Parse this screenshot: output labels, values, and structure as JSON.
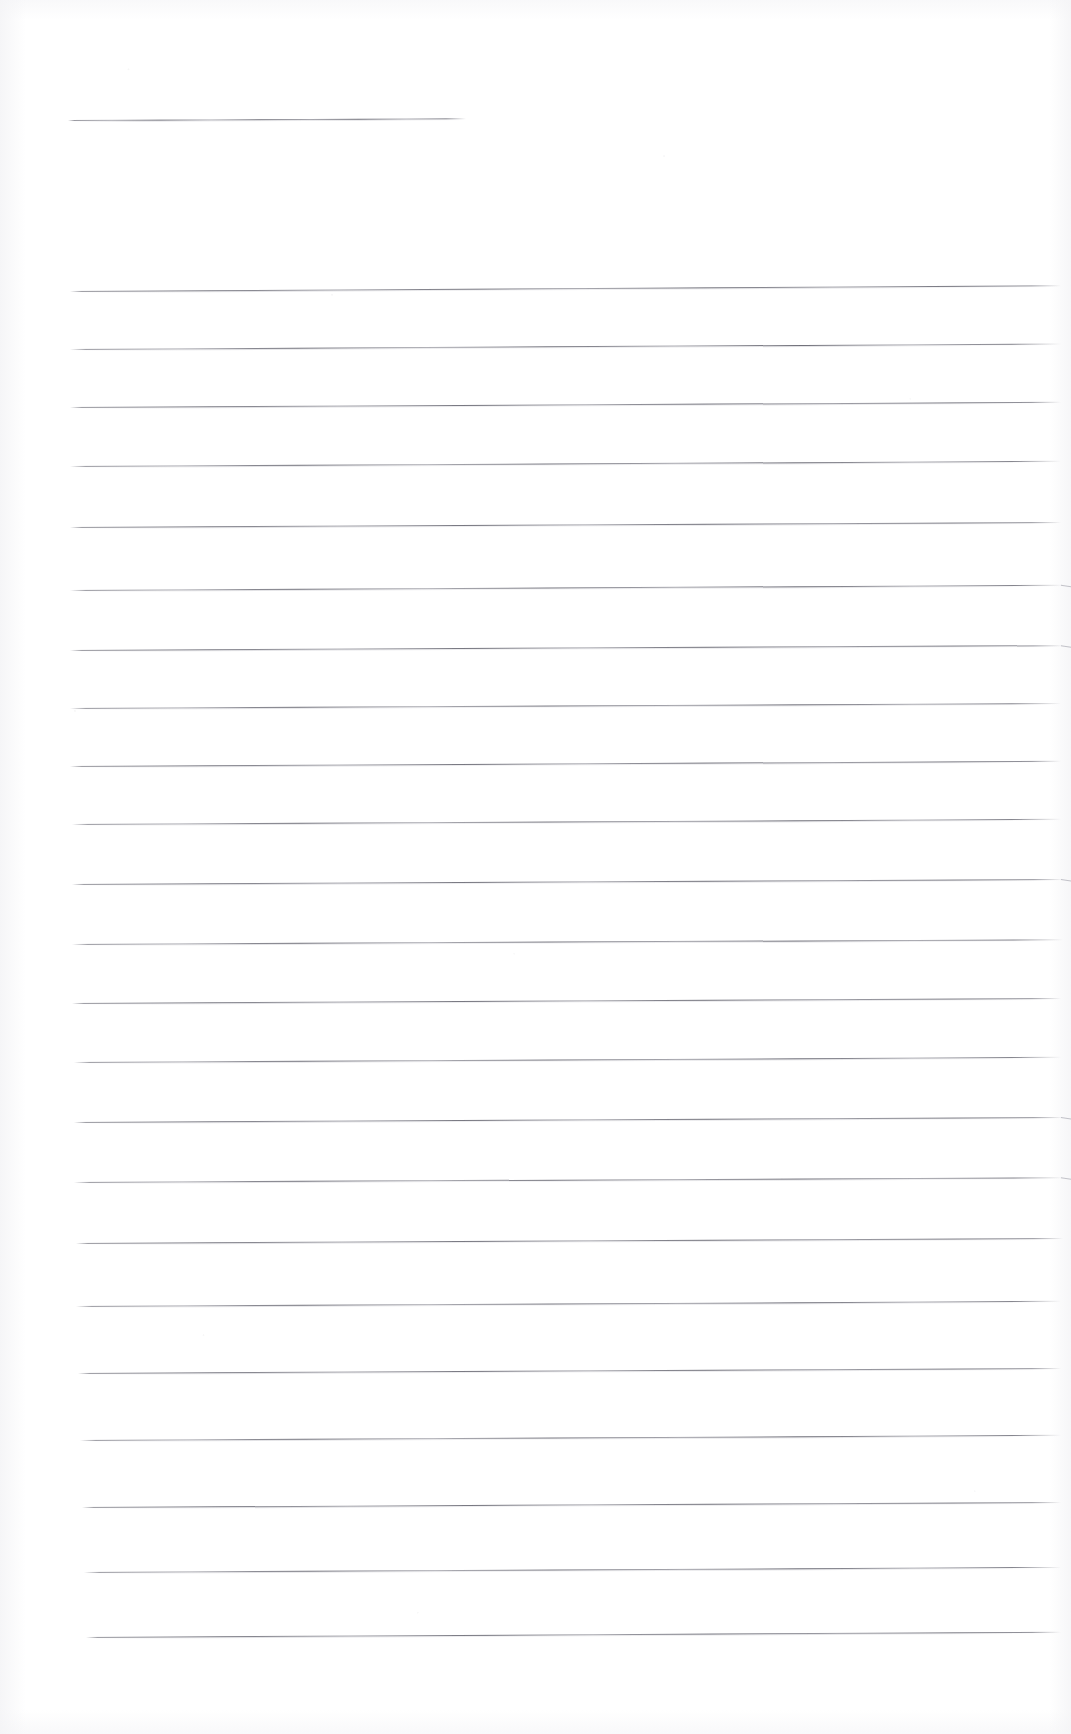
{
  "document": {
    "kind": "scanned-lined-paper",
    "title": "Blank ruled notepaper sheet",
    "page_width": 1071,
    "page_height": 1734,
    "background_color": "#ffffff",
    "rule_color": "#70707a",
    "text_content": "",
    "visible_text": []
  },
  "rules": [
    {
      "name": "rule-header",
      "x": 68,
      "y": 120,
      "width": 398,
      "rotate": -0.26,
      "style": "alt",
      "hooked": false
    },
    {
      "name": "rule-01",
      "x": 70,
      "y": 291,
      "width": 991,
      "rotate": -0.33,
      "style": "",
      "hooked": false
    },
    {
      "name": "rule-02",
      "x": 70,
      "y": 349,
      "width": 991,
      "rotate": -0.32,
      "style": "alt",
      "hooked": false
    },
    {
      "name": "rule-03",
      "x": 70,
      "y": 407,
      "width": 991,
      "rotate": -0.3,
      "style": "",
      "hooked": false
    },
    {
      "name": "rule-04",
      "x": 70,
      "y": 466,
      "width": 991,
      "rotate": -0.3,
      "style": "alt",
      "hooked": false
    },
    {
      "name": "rule-05",
      "x": 70,
      "y": 527,
      "width": 991,
      "rotate": -0.29,
      "style": "",
      "hooked": false
    },
    {
      "name": "rule-06",
      "x": 70,
      "y": 590,
      "width": 993,
      "rotate": -0.3,
      "style": "alt",
      "hooked": true
    },
    {
      "name": "rule-07",
      "x": 70,
      "y": 650,
      "width": 993,
      "rotate": -0.28,
      "style": "",
      "hooked": true
    },
    {
      "name": "rule-08",
      "x": 70,
      "y": 708,
      "width": 991,
      "rotate": -0.29,
      "style": "alt",
      "hooked": false
    },
    {
      "name": "rule-09",
      "x": 70,
      "y": 766,
      "width": 991,
      "rotate": -0.3,
      "style": "",
      "hooked": false
    },
    {
      "name": "rule-10",
      "x": 72,
      "y": 824,
      "width": 989,
      "rotate": -0.3,
      "style": "alt",
      "hooked": false
    },
    {
      "name": "rule-11",
      "x": 72,
      "y": 884,
      "width": 991,
      "rotate": -0.29,
      "style": "",
      "hooked": true
    },
    {
      "name": "rule-12",
      "x": 72,
      "y": 944,
      "width": 991,
      "rotate": -0.28,
      "style": "alt",
      "hooked": false
    },
    {
      "name": "rule-13",
      "x": 72,
      "y": 1003,
      "width": 989,
      "rotate": -0.29,
      "style": "",
      "hooked": false
    },
    {
      "name": "rule-14",
      "x": 74,
      "y": 1062,
      "width": 987,
      "rotate": -0.3,
      "style": "alt",
      "hooked": false
    },
    {
      "name": "rule-15",
      "x": 74,
      "y": 1122,
      "width": 989,
      "rotate": -0.29,
      "style": "",
      "hooked": true
    },
    {
      "name": "rule-16",
      "x": 74,
      "y": 1182,
      "width": 989,
      "rotate": -0.28,
      "style": "alt",
      "hooked": true
    },
    {
      "name": "rule-17",
      "x": 76,
      "y": 1243,
      "width": 987,
      "rotate": -0.29,
      "style": "",
      "hooked": false
    },
    {
      "name": "rule-18",
      "x": 76,
      "y": 1306,
      "width": 985,
      "rotate": -0.3,
      "style": "alt",
      "hooked": false
    },
    {
      "name": "rule-19",
      "x": 78,
      "y": 1373,
      "width": 983,
      "rotate": -0.29,
      "style": "",
      "hooked": false
    },
    {
      "name": "rule-20",
      "x": 80,
      "y": 1440,
      "width": 981,
      "rotate": -0.3,
      "style": "alt",
      "hooked": false
    },
    {
      "name": "rule-21",
      "x": 82,
      "y": 1507,
      "width": 979,
      "rotate": -0.29,
      "style": "",
      "hooked": false
    },
    {
      "name": "rule-22",
      "x": 84,
      "y": 1572,
      "width": 977,
      "rotate": -0.3,
      "style": "alt",
      "hooked": false
    },
    {
      "name": "rule-23",
      "x": 86,
      "y": 1637,
      "width": 975,
      "rotate": -0.31,
      "style": "",
      "hooked": false
    }
  ]
}
